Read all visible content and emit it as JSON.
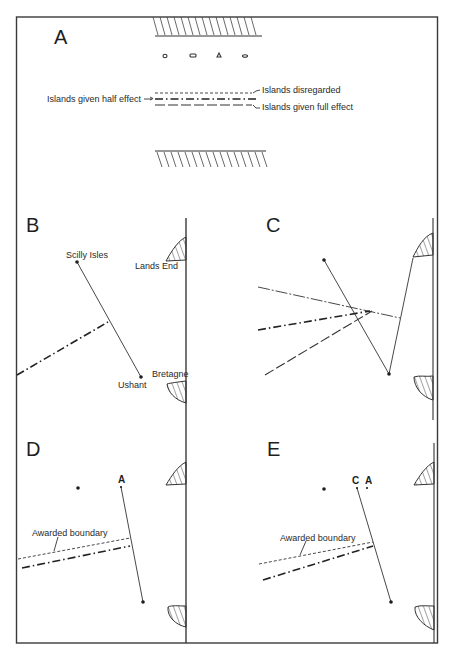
{
  "figure": {
    "panels": {
      "A": {
        "letter": "A",
        "legend": {
          "disregarded": "Islands disregarded",
          "half_effect": "Islands given half effect",
          "full_effect": "Islands given full effect"
        }
      },
      "B": {
        "letter": "B",
        "labels": {
          "scilly": "Scilly Isles",
          "lands_end": "Lands End",
          "bretagne": "Bretagne",
          "ushant": "Ushant"
        }
      },
      "C": {
        "letter": "C"
      },
      "D": {
        "letter": "D",
        "point_a": "A",
        "awarded": "Awarded boundary"
      },
      "E": {
        "letter": "E",
        "point_c": "C",
        "point_a": "A",
        "awarded": "Awarded boundary"
      }
    },
    "colors": {
      "ink": "#1e1e1e",
      "paper": "#ffffff"
    }
  }
}
